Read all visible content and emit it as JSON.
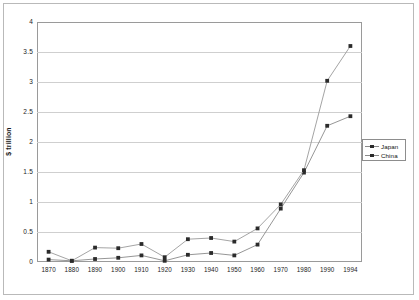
{
  "chart_data": {
    "type": "line",
    "title": "",
    "xlabel": "",
    "ylabel": "$ trillion",
    "x": [
      1870,
      1880,
      1890,
      1900,
      1910,
      1920,
      1930,
      1940,
      1950,
      1960,
      1970,
      1980,
      1990,
      1994
    ],
    "xticklabels": [
      "1870",
      "1880",
      "1890",
      "1900",
      "1910",
      "1920",
      "1930",
      "1940",
      "1950",
      "1960",
      "1970",
      "1980",
      "1990",
      "1994"
    ],
    "yticklabels": [
      "0",
      "0.5",
      "1",
      "1.5",
      "2",
      "2.5",
      "3",
      "3.5",
      "4"
    ],
    "yticks": [
      0,
      0.5,
      1,
      1.5,
      2,
      2.5,
      3,
      3.5,
      4
    ],
    "ylim": [
      0,
      4
    ],
    "grid": "horizontal",
    "legend_position": "right",
    "series": [
      {
        "name": "Japan",
        "color": "#8a8a8a",
        "marker": "square",
        "marker_color": "#2b2b2b",
        "values": [
          0.04,
          0.02,
          0.05,
          0.07,
          0.11,
          0.02,
          0.12,
          0.15,
          0.11,
          0.29,
          0.89,
          1.49,
          2.27,
          2.43
        ]
      },
      {
        "name": "China",
        "color": "#9a9a9a",
        "marker": "square",
        "marker_color": "#2b2b2b",
        "values": [
          0.17,
          0.02,
          0.24,
          0.23,
          0.3,
          0.08,
          0.38,
          0.4,
          0.34,
          0.56,
          0.96,
          1.53,
          3.02,
          3.6
        ]
      }
    ]
  },
  "legend": {
    "entries": [
      {
        "label": "Japan"
      },
      {
        "label": "China"
      }
    ]
  }
}
